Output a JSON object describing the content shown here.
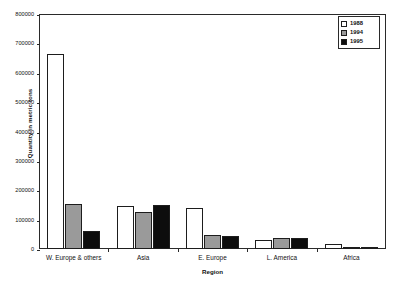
{
  "chart_data": {
    "type": "bar",
    "title": "",
    "subtitle": "",
    "xlabel": "Region",
    "ylabel": "Quantity in metric tons",
    "categories": [
      "W. Europe & others",
      "Asia",
      "E. Europe",
      "L. America",
      "Africa"
    ],
    "series": [
      {
        "name": "1988",
        "color": "#ffffff",
        "values": [
          665000,
          148000,
          139000,
          29000,
          18000
        ]
      },
      {
        "name": "1994",
        "color": "#9a9a9a",
        "values": [
          152000,
          125000,
          49000,
          39000,
          3000
        ]
      },
      {
        "name": "1995",
        "color": "#0d0d0d",
        "values": [
          63000,
          151000,
          46000,
          36000,
          2000
        ]
      }
    ],
    "ylim": [
      0,
      800000
    ],
    "ytick_step": 100000,
    "ytick_labels": [
      "0",
      "100000",
      "200000",
      "300000",
      "400000",
      "500000",
      "600000",
      "700000",
      "800000"
    ],
    "grid": false,
    "legend_position": "top-right",
    "legend_entries": [
      "1988",
      "1994",
      "1995"
    ],
    "bar_outline_color": "#1d1d1d",
    "axis_color": "#2a2a2a",
    "background_color": "#ffffff"
  }
}
